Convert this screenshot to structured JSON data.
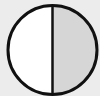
{
  "figure": {
    "colors": {
      "background": "#ececec",
      "left_half": "#ffffff",
      "right_half": "#d6d6d6",
      "outline": "#111111"
    },
    "circle": {
      "cx": 52.5,
      "cy": 50,
      "r": 44.5
    },
    "halves": [
      {
        "name": "left",
        "shaded": false
      },
      {
        "name": "right",
        "shaded": true
      }
    ]
  }
}
